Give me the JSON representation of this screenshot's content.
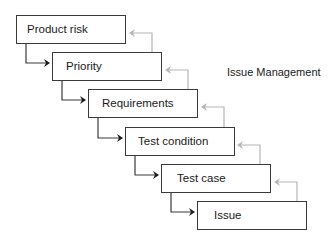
{
  "diagram": {
    "title": "Issue Management",
    "steps": [
      {
        "label": "Product risk"
      },
      {
        "label": "Priority"
      },
      {
        "label": "Requirements"
      },
      {
        "label": "Test condition"
      },
      {
        "label": "Test case"
      },
      {
        "label": "Issue"
      }
    ],
    "colors": {
      "forward_arrow": "#3a3a3a",
      "return_arrow": "#b5b5b5",
      "box_border": "#3a3a3a"
    }
  }
}
